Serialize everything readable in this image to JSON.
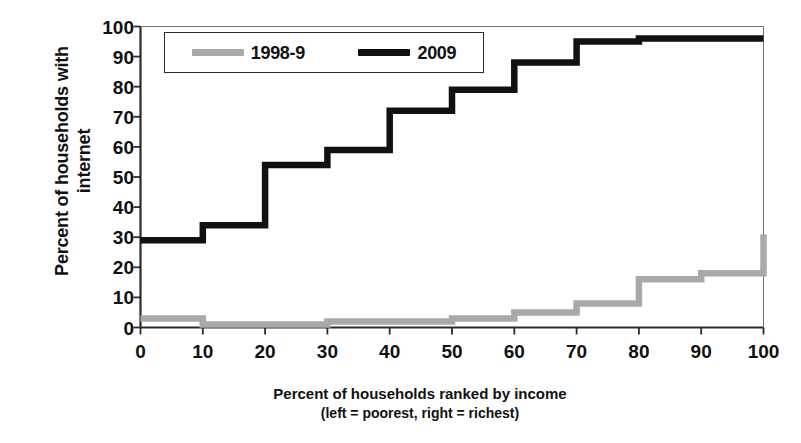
{
  "chart_data": {
    "type": "line",
    "title": "",
    "xlabel": "Percent of households  ranked by income",
    "xlabel_line2": "(left = poorest, right = richest)",
    "ylabel_line1": "Percent of households with",
    "ylabel_line2": "internet",
    "xlim": [
      0,
      100
    ],
    "ylim": [
      0,
      100
    ],
    "xticks": [
      0,
      10,
      20,
      30,
      40,
      50,
      60,
      70,
      80,
      90,
      100
    ],
    "yticks": [
      0,
      10,
      20,
      30,
      40,
      50,
      60,
      70,
      80,
      90,
      100
    ],
    "xtick_labels": [
      "0",
      "10",
      "20",
      "30",
      "40",
      "50",
      "60",
      "70",
      "80",
      "90",
      "100"
    ],
    "ytick_labels": [
      "0",
      "10",
      "20",
      "30",
      "40",
      "50",
      "60",
      "70",
      "80",
      "90",
      "100"
    ],
    "grid": false,
    "step_style": "post",
    "legend_position": "upper-left-inside",
    "decile_bounds": [
      0,
      10,
      20,
      30,
      40,
      50,
      60,
      70,
      80,
      90,
      100
    ],
    "series": [
      {
        "name": "1998-9",
        "color": "#a9a9a9",
        "values": [
          3,
          1,
          1,
          2,
          2,
          3,
          5,
          8,
          16,
          18,
          31
        ]
      },
      {
        "name": "2009",
        "color": "#111111",
        "values": [
          29,
          34,
          54,
          59,
          72,
          79,
          88,
          95,
          96,
          96,
          96
        ]
      }
    ]
  },
  "legend": {
    "entries": [
      {
        "label": "1998-9",
        "color": "#a9a9a9"
      },
      {
        "label": "2009",
        "color": "#111111"
      }
    ]
  },
  "axes": {
    "y_title_line1": "Percent of households with",
    "y_title_line2": "internet",
    "x_title_line1": "Percent of households  ranked by income",
    "x_title_line2": "(left = poorest, right = richest)"
  }
}
